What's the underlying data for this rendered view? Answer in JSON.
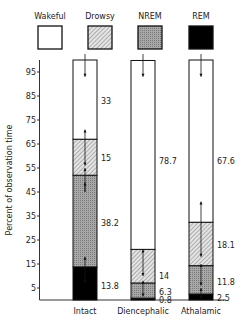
{
  "chart_data": {
    "type": "bar",
    "stacked": true,
    "title": "",
    "xlabel": "",
    "ylabel": "Percent of observation time",
    "ylim": [
      0,
      100
    ],
    "yticks": [
      5,
      15,
      25,
      35,
      45,
      55,
      65,
      75,
      85,
      95
    ],
    "categories": [
      "Intact",
      "Diencephalic",
      "Athalamic"
    ],
    "legend": [
      {
        "name": "Wakeful",
        "fill": "white"
      },
      {
        "name": "Drowsy",
        "fill": "hatched"
      },
      {
        "name": "NREM",
        "fill": "stippled-gray"
      },
      {
        "name": "REM",
        "fill": "black"
      }
    ],
    "series": [
      {
        "name": "REM",
        "values": [
          13.8,
          0.8,
          2.5
        ],
        "labels": [
          "13.8",
          "0.8",
          "2.5"
        ]
      },
      {
        "name": "NREM",
        "values": [
          38.2,
          6.3,
          11.8
        ],
        "labels": [
          "38.2",
          "6.3",
          "11.8"
        ]
      },
      {
        "name": "Drowsy",
        "values": [
          15,
          14,
          18.1
        ],
        "labels": [
          "15",
          "14",
          "18.1"
        ]
      },
      {
        "name": "Wakeful",
        "values": [
          33,
          78.7,
          67.6
        ],
        "labels": [
          "33",
          "78.7",
          "67.6"
        ]
      }
    ],
    "grid": false,
    "legend_position": "top"
  }
}
